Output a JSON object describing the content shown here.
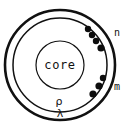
{
  "diagram": {
    "type": "atomic-shell-diagram",
    "canvas": {
      "width": 135,
      "height": 127
    },
    "center": {
      "x": 60,
      "y": 65
    },
    "colors": {
      "stroke": "#111111",
      "dot": "#0d0d0d",
      "background": "#ffffff"
    },
    "core": {
      "label": "core",
      "radius": 24,
      "label_x": 60,
      "label_y": 65
    },
    "shells": [
      {
        "name": "lambda-shell",
        "label": "λ",
        "radius": 55,
        "stroke_width": 2.6,
        "label_x": 60,
        "label_y": 114
      },
      {
        "name": "rho-shell",
        "label": "ρ",
        "radius": 47,
        "stroke_width": 1.5,
        "label_x": 59,
        "label_y": 102
      }
    ],
    "groups": [
      {
        "name": "n-group",
        "label": "n",
        "label_x": 114,
        "label_y": 33,
        "count": 4,
        "dots": [
          {
            "x": 88,
            "y": 29,
            "r": 3.2
          },
          {
            "x": 92,
            "y": 35,
            "r": 3.2
          },
          {
            "x": 96,
            "y": 41,
            "r": 3.2
          },
          {
            "x": 101,
            "y": 48,
            "r": 3.6
          }
        ]
      },
      {
        "name": "m-group",
        "label": "m",
        "label_x": 114,
        "label_y": 87,
        "count": 3,
        "dots": [
          {
            "x": 103,
            "y": 78,
            "r": 3.2
          },
          {
            "x": 99,
            "y": 86,
            "r": 3.6
          },
          {
            "x": 93,
            "y": 94,
            "r": 3.6
          }
        ]
      }
    ]
  }
}
